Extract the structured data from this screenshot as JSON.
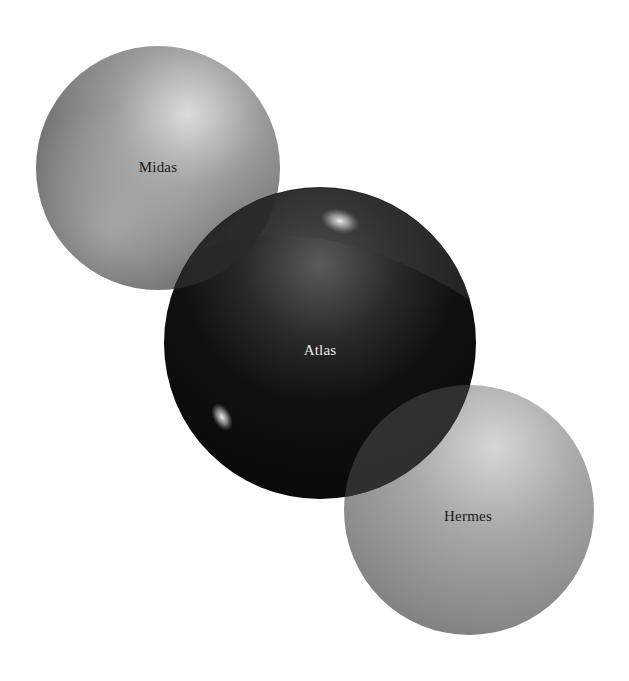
{
  "diagram": {
    "type": "overlapping-spheres",
    "background": "#ffffff",
    "spheres": [
      {
        "id": "midas",
        "label": "Midas",
        "cx": 158,
        "cy": 168,
        "r": 122,
        "base": "#8a8a8a",
        "light": "#d8d8d8",
        "dark": "#4a4a4a",
        "text_color": "#1a1a1a",
        "label_x": 158,
        "label_y": 167
      },
      {
        "id": "atlas",
        "label": "Atlas",
        "cx": 320,
        "cy": 343,
        "r": 156,
        "base": "#141414",
        "light": "#6a6a6a",
        "dark": "#050505",
        "text_color": "#e8e8e8",
        "label_x": 320,
        "label_y": 350
      },
      {
        "id": "hermes",
        "label": "Hermes",
        "cx": 469,
        "cy": 510,
        "r": 125,
        "base": "#9a9a9a",
        "light": "#d0d0d0",
        "dark": "#6a6a6a",
        "text_color": "#1a1a1a",
        "label_x": 468,
        "label_y": 516
      }
    ],
    "intersections": [
      {
        "between": [
          "midas",
          "atlas"
        ],
        "color": "#2e2e2e"
      },
      {
        "between": [
          "atlas",
          "hermes"
        ],
        "color": "#3a3a3a"
      }
    ]
  }
}
